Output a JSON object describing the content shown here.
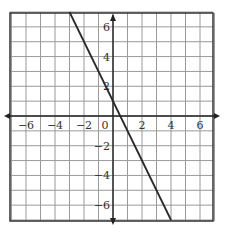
{
  "chart_data": {
    "type": "line",
    "title": "",
    "xlabel": "",
    "ylabel": "",
    "xlim": [
      -7,
      7
    ],
    "ylim": [
      -7,
      7
    ],
    "grid": true,
    "grid_step": 1,
    "x_tick_labels": [
      {
        "value": -6,
        "label": "−6"
      },
      {
        "value": -4,
        "label": "−4"
      },
      {
        "value": -2,
        "label": "−2"
      },
      {
        "value": 0,
        "label": "0"
      },
      {
        "value": 2,
        "label": "2"
      },
      {
        "value": 4,
        "label": "4"
      },
      {
        "value": 6,
        "label": "6"
      }
    ],
    "y_tick_labels": [
      {
        "value": 6,
        "label": "6"
      },
      {
        "value": 4,
        "label": "4"
      },
      {
        "value": 2,
        "label": "2"
      },
      {
        "value": -2,
        "label": "−2"
      },
      {
        "value": -4,
        "label": "−4"
      },
      {
        "value": -6,
        "label": "−6"
      }
    ],
    "series": [
      {
        "name": "line",
        "equation": "y = -2x + 1",
        "slope": -2,
        "intercept": 1,
        "x": [
          -3,
          4
        ],
        "y": [
          7,
          -7
        ]
      }
    ],
    "colors": {
      "grid": "#9a9a9a",
      "border": "#333333",
      "axis": "#222222",
      "line": "#2a2a2a"
    }
  }
}
